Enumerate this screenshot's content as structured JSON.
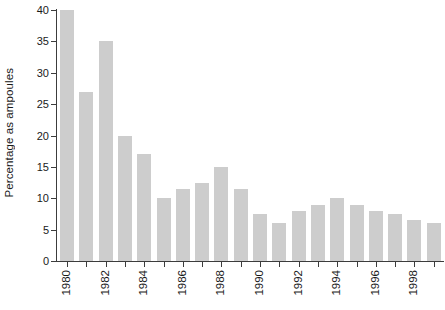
{
  "chart_data": {
    "type": "bar",
    "title": "",
    "xlabel": "",
    "ylabel": "Percentage as ampoules",
    "categories": [
      "1980",
      "1981",
      "1982",
      "1983",
      "1984",
      "1985",
      "1986",
      "1987",
      "1988",
      "1989",
      "1990",
      "1991",
      "1992",
      "1993",
      "1994",
      "1995",
      "1996",
      "1997",
      "1998",
      "1999"
    ],
    "values": [
      40,
      27,
      35,
      20,
      17,
      10,
      11.5,
      12.5,
      15,
      11.5,
      7.5,
      6,
      8,
      9,
      10,
      9,
      8,
      7.5,
      6.5,
      6
    ],
    "ylim": [
      0,
      40
    ],
    "yticks": [
      0,
      5,
      10,
      15,
      20,
      25,
      30,
      35,
      40
    ],
    "ytick_labels": [
      "0",
      "5",
      "10",
      "15",
      "20",
      "25",
      "30",
      "35",
      "40"
    ],
    "xtick_labels": [
      "1980",
      "",
      "1982",
      "",
      "1984",
      "",
      "1986",
      "",
      "1988",
      "",
      "1990",
      "",
      "1992",
      "",
      "1994",
      "",
      "1996",
      "",
      "1998",
      ""
    ],
    "grid": false,
    "legend": null,
    "bar_color": "#cdcdcd",
    "axis_color": "#3c3c3c",
    "text_color": "#1a1a1a",
    "background": "#ffffff"
  }
}
